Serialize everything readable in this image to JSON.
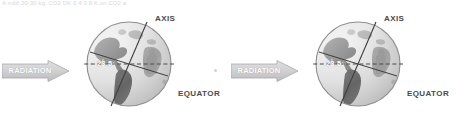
{
  "page": {
    "background_color": "#ffffff",
    "top_caption": "A mild 20-30 kg. CO2 DK 0.4 0.8 K on CO2 a",
    "width": 457,
    "height": 128
  },
  "colors": {
    "arrow_fill": "#d3d3d5",
    "arrow_stroke": "#a8a8ab",
    "arrow_text": "#ffffff",
    "label_text": "#4a4a4a",
    "globe_ocean_light": "#e2e2e2",
    "globe_ocean_mid": "#cfcfcf",
    "globe_land_dark": "#6e6e6e",
    "globe_land_mid": "#9a9a9a",
    "globe_outline": "#8d8d8d",
    "axis_line": "#3f3f3f",
    "equator_dash": "#4a4a4a",
    "tilt_text": "#ffffff",
    "mid_dot": "#d2d2d6"
  },
  "diagrams": [
    {
      "id": "left",
      "name": "earth-axial-tilt-diagram-left",
      "radiation": {
        "label": "RADIATION",
        "icon": "right-arrow-icon"
      },
      "globe": {
        "name": "earth-globe",
        "axis_label": "AXIS",
        "equator_label": "EQUATOR",
        "tilt_label": "23.5",
        "tilt_degrees": 23.5,
        "has_human_figure": true
      }
    },
    {
      "id": "right",
      "name": "earth-axial-tilt-diagram-right",
      "radiation": {
        "label": "RADIATION",
        "icon": "right-arrow-icon"
      },
      "globe": {
        "name": "earth-globe",
        "axis_label": "AXIS",
        "equator_label": "EQUATOR",
        "tilt_label": "23.5",
        "tilt_degrees": 23.5,
        "has_human_figure": true
      }
    }
  ]
}
